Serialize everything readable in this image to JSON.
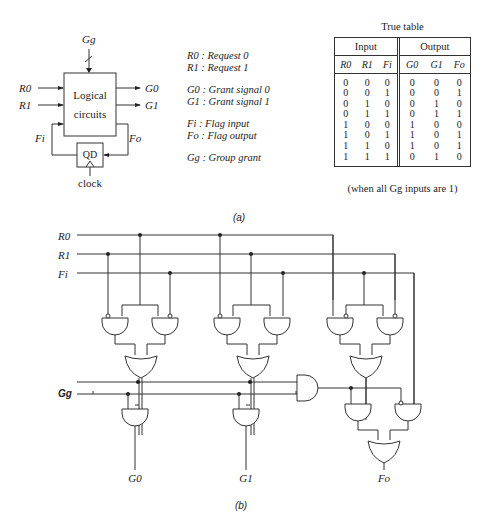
{
  "figure_a": {
    "caption": "(a)",
    "block": {
      "title_line1": "Logical",
      "title_line2": "circuits",
      "inputs": [
        "R0",
        "R1",
        "Fi"
      ],
      "outputs": [
        "G0",
        "G1",
        "Fo"
      ],
      "top_input": "Gg",
      "flipflop_label": "QD",
      "clock_label": "clock"
    },
    "legend": [
      {
        "sym": "R0",
        "text": " : Request 0"
      },
      {
        "sym": "R1",
        "text": " : Request 1"
      },
      {
        "sym": "G0",
        "text": " : Grant signal 0"
      },
      {
        "sym": "G1",
        "text": " : Grant signal 1"
      },
      {
        "sym": "Fi",
        "text": " : Flag input"
      },
      {
        "sym": "Fo",
        "text": " : Flag output"
      },
      {
        "sym": "Gg",
        "text": " : Group grant"
      }
    ],
    "truth_table": {
      "title": "True table",
      "group_headers": [
        "Input",
        "Output"
      ],
      "columns": [
        "R0",
        "R1",
        "Fi",
        "G0",
        "G1",
        "Fo"
      ],
      "rows": [
        [
          "0",
          "0",
          "0",
          "0",
          "0",
          "0"
        ],
        [
          "0",
          "0",
          "1",
          "0",
          "0",
          "1"
        ],
        [
          "0",
          "1",
          "0",
          "0",
          "1",
          "0"
        ],
        [
          "0",
          "1",
          "1",
          "0",
          "1",
          "1"
        ],
        [
          "1",
          "0",
          "0",
          "1",
          "0",
          "0"
        ],
        [
          "1",
          "0",
          "1",
          "1",
          "0",
          "1"
        ],
        [
          "1",
          "1",
          "0",
          "1",
          "0",
          "1"
        ],
        [
          "1",
          "1",
          "1",
          "0",
          "1",
          "0"
        ]
      ],
      "note": "(when all Gg inputs are 1)"
    }
  },
  "figure_b": {
    "caption": "(b)",
    "input_labels": [
      "R0",
      "R1",
      "Fi",
      "Gg"
    ],
    "output_labels": [
      "G0",
      "G1",
      "Fo"
    ]
  }
}
